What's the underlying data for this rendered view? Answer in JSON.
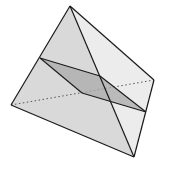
{
  "diagram": {
    "type": "tetrahedron-cross-section",
    "colors": {
      "background": "#ffffff",
      "face_left": "#d9d9d9",
      "face_right": "#ececec",
      "face_front": "#d4d4d4",
      "section": "#a9a9a9",
      "edge": "#1a1a1a",
      "hidden_edge": "#555555"
    },
    "vertices": {
      "apex": [
        70,
        6
      ],
      "left": [
        11,
        105
      ],
      "bottom": [
        134,
        157
      ],
      "right": [
        154,
        80
      ]
    },
    "section_points": {
      "p_left": [
        40,
        58
      ],
      "p_top": [
        100,
        76
      ],
      "p_right": [
        146,
        112
      ],
      "p_inner": [
        82,
        93
      ]
    }
  }
}
